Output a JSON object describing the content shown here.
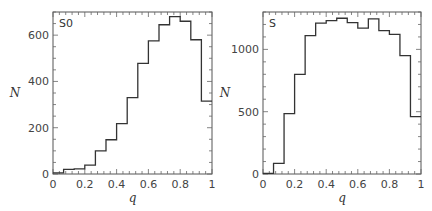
{
  "chart_data": [
    {
      "type": "bar",
      "subtype": "step-histogram",
      "panel_label": "S0",
      "xlabel": "q",
      "ylabel": "N",
      "xlim": [
        0,
        1
      ],
      "ylim": [
        0,
        700
      ],
      "x_ticks": [
        "0",
        "0.2",
        "0.4",
        "0.6",
        "0.8",
        "1"
      ],
      "y_ticks": [
        "0",
        "200",
        "400",
        "600"
      ],
      "bin_edges": [
        0,
        0.0667,
        0.1333,
        0.2,
        0.2667,
        0.3333,
        0.4,
        0.4667,
        0.5333,
        0.6,
        0.6667,
        0.7333,
        0.8,
        0.8667,
        0.9333,
        1.0
      ],
      "values": [
        5,
        20,
        22,
        38,
        100,
        148,
        218,
        330,
        478,
        575,
        645,
        680,
        660,
        580,
        315
      ],
      "grid": false
    },
    {
      "type": "bar",
      "subtype": "step-histogram",
      "panel_label": "S",
      "xlabel": "q",
      "ylabel": "N",
      "xlim": [
        0,
        1
      ],
      "ylim": [
        0,
        1300
      ],
      "x_ticks": [
        "0",
        "0.2",
        "0.4",
        "0.6",
        "0.8",
        "1"
      ],
      "y_ticks": [
        "0",
        "500",
        "1000"
      ],
      "bin_edges": [
        0,
        0.0667,
        0.1333,
        0.2,
        0.2667,
        0.3333,
        0.4,
        0.4667,
        0.5333,
        0.6,
        0.6667,
        0.7333,
        0.8,
        0.8667,
        0.9333,
        1.0
      ],
      "values": [
        5,
        85,
        485,
        800,
        1110,
        1210,
        1230,
        1250,
        1215,
        1170,
        1245,
        1150,
        1120,
        950,
        460
      ],
      "grid": false
    }
  ],
  "panels": [
    {
      "name": "s0",
      "frame": {
        "x0": 53,
        "y0": 12,
        "x1": 212,
        "y1": 174
      },
      "y_minor_step": 50,
      "y_major_step": 200
    },
    {
      "name": "s",
      "frame": {
        "x0": 263,
        "y0": 12,
        "x1": 421,
        "y1": 174
      },
      "y_minor_step": 100,
      "y_major_step": 500
    }
  ]
}
